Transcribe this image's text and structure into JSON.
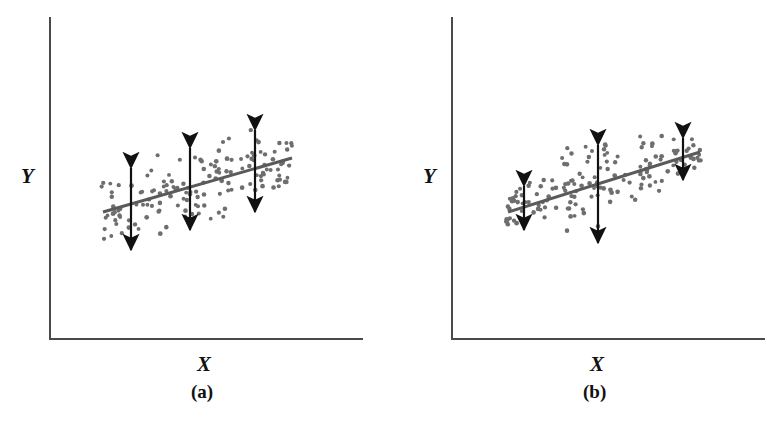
{
  "figure": {
    "dot_color": "#6e6e6e",
    "line_color": "#5a5a5a",
    "axis_color": "#4a4a4a",
    "arrow_color": "#111111",
    "background": "#ffffff"
  },
  "panels": [
    {
      "id": "a",
      "caption": "(a)",
      "x_label": "X",
      "y_label": "Y",
      "condition": "homoscedasticity",
      "axes": {
        "x0": 50,
        "y_top": 18,
        "y_bottom": 339,
        "x_right": 362
      },
      "regression_line": {
        "x1": 103,
        "y1": 212,
        "x2": 292,
        "y2": 158
      },
      "spread_arrows": [
        {
          "x": 131,
          "y_top": 168,
          "y_bottom": 250,
          "length": 82
        },
        {
          "x": 190,
          "y_top": 148,
          "y_bottom": 230,
          "length": 82
        },
        {
          "x": 255,
          "y_top": 130,
          "y_bottom": 212,
          "length": 82
        }
      ],
      "cloud": {
        "shape": "uniform-band",
        "x_min": 100,
        "x_max": 295,
        "half_height_left": 42,
        "half_height_right": 42,
        "n_points": 150
      }
    },
    {
      "id": "b",
      "caption": "(b)",
      "x_label": "X",
      "y_label": "Y",
      "condition": "heteroscedasticity",
      "axes": {
        "x0": 68,
        "y_top": 18,
        "y_bottom": 339,
        "x_right": 380
      },
      "regression_line": {
        "x1": 508,
        "y1": 212,
        "x2": 700,
        "y2": 152
      },
      "spread_arrows": [
        {
          "x": 524,
          "y_top": 186,
          "y_bottom": 230,
          "length": 44
        },
        {
          "x": 598,
          "y_top": 145,
          "y_bottom": 243,
          "length": 98
        },
        {
          "x": 683,
          "y_top": 138,
          "y_bottom": 180,
          "length": 42
        }
      ],
      "cloud": {
        "shape": "lens",
        "x_min": 505,
        "x_max": 703,
        "half_height_left": 16,
        "half_height_mid": 50,
        "half_height_right": 16,
        "n_points": 150
      }
    }
  ],
  "chart_data": {
    "type": "scatter",
    "title": "",
    "xlabel": "X",
    "ylabel": "Y",
    "grid": false,
    "legend": null,
    "subplots": [
      {
        "label": "(a)",
        "description": "Constant error variance (homoscedasticity): scatter forms a band of uniform vertical width about the regression line; the three double-headed arrows marking spread are of equal length.",
        "xlim": [
          0,
          10
        ],
        "ylim": [
          0,
          10
        ],
        "fit_line": {
          "intercept": 3.6,
          "slope": 0.42
        },
        "spread_markers": [
          {
            "x": 1.8,
            "spread": 2.1
          },
          {
            "x": 4.5,
            "spread": 2.1
          },
          {
            "x": 7.4,
            "spread": 2.1
          }
        ],
        "n_points": 150
      },
      {
        "label": "(b)",
        "description": "Non-constant error variance (heteroscedasticity): scatter forms a lens/football shape, narrow at both ends and widest in the middle; the middle double-headed arrow is far longer than the outer two.",
        "xlim": [
          0,
          10
        ],
        "ylim": [
          0,
          10
        ],
        "fit_line": {
          "intercept": 3.6,
          "slope": 0.45
        },
        "spread_markers": [
          {
            "x": 1.0,
            "spread": 1.1
          },
          {
            "x": 4.7,
            "spread": 2.5
          },
          {
            "x": 8.9,
            "spread": 1.05
          }
        ],
        "n_points": 150
      }
    ]
  }
}
